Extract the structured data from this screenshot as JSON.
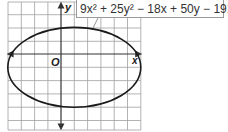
{
  "figure": {
    "equation": "9x² + 25y² − 18x + 50y − 191 = 0",
    "axis_labels": {
      "x": "x",
      "y": "y",
      "origin": "O"
    },
    "grid": {
      "x_min": -4,
      "x_max": 6,
      "y_min": -5,
      "y_max": 4,
      "step": 1
    },
    "ellipse": {
      "center": [
        1,
        -1
      ],
      "semi_major_x": 5,
      "semi_minor_y": 3
    },
    "colors": {
      "grid": "#9a9a9a",
      "axis": "#333333",
      "curve": "#1a1a1a"
    }
  }
}
